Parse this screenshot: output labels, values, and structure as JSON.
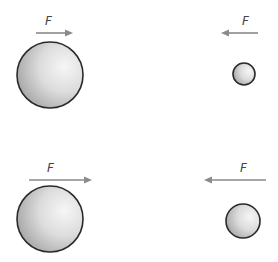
{
  "diagram": {
    "colors": {
      "background": "#ffffff",
      "arrow": "#8a8a8a",
      "outline": "#2a2a2a",
      "shade_dark": "#9c9c9c",
      "shade_light": "#f4f4f4"
    },
    "panels": [
      {
        "id": "top-left",
        "force_label": "F",
        "arrow_direction": "right",
        "sphere_size": "large",
        "arrow": {
          "x1": 36,
          "x2": 72,
          "y": 33
        },
        "label_pos": {
          "x": 45,
          "y": 25
        },
        "sphere": {
          "cx": 50,
          "cy": 75,
          "r": 33
        }
      },
      {
        "id": "top-right",
        "force_label": "F",
        "arrow_direction": "left",
        "sphere_size": "small",
        "arrow": {
          "x1": 258,
          "x2": 222,
          "y": 33
        },
        "label_pos": {
          "x": 242,
          "y": 25
        },
        "sphere": {
          "cx": 244,
          "cy": 74,
          "r": 11
        }
      },
      {
        "id": "bottom-left",
        "force_label": "F",
        "arrow_direction": "right",
        "sphere_size": "large",
        "arrow": {
          "x1": 29,
          "x2": 91,
          "y": 180
        },
        "label_pos": {
          "x": 47,
          "y": 172
        },
        "sphere": {
          "cx": 50,
          "cy": 219,
          "r": 33
        }
      },
      {
        "id": "bottom-right",
        "force_label": "F",
        "arrow_direction": "left",
        "sphere_size": "medium",
        "arrow": {
          "x1": 266,
          "x2": 205,
          "y": 180
        },
        "label_pos": {
          "x": 240,
          "y": 172
        },
        "sphere": {
          "cx": 243,
          "cy": 221,
          "r": 17
        }
      }
    ]
  }
}
